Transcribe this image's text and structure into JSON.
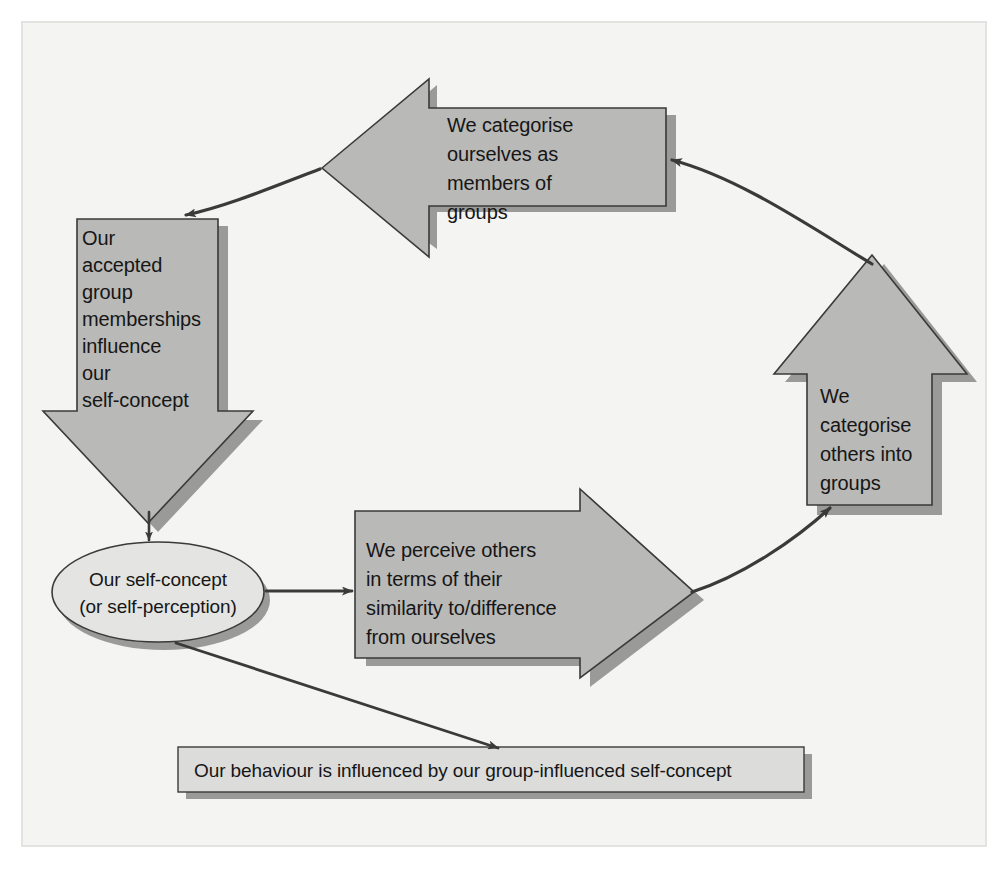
{
  "figure": {
    "frame": {
      "background_color": "#f4f4f2",
      "border_color": "#e2e2e0",
      "page_color": "#ffffff"
    },
    "palette": {
      "arrow_fill": "#b9b9b7",
      "arrow_stroke": "#3a3a3a",
      "arrow_shadow": "#9a9a98",
      "box_fill": "#dcdcda",
      "ellipse_fill": "#e4e4e2",
      "connector_color": "#3a3a3a",
      "text_color": "#161616"
    },
    "nodes": [
      {
        "id": "categorise-self",
        "shape": "left-arrow",
        "lines": [
          "We categorise",
          "ourselves as",
          "members of",
          "groups"
        ]
      },
      {
        "id": "group-memberships",
        "shape": "down-arrow",
        "lines": [
          "Our",
          "accepted",
          "group",
          "memberships",
          "influence",
          "our",
          "self-concept"
        ]
      },
      {
        "id": "self-concept",
        "shape": "ellipse",
        "lines": [
          "Our self-concept",
          "(or self-perception)"
        ]
      },
      {
        "id": "perceive-others",
        "shape": "right-arrow",
        "lines": [
          "We perceive others",
          "in terms of their",
          "similarity to/difference",
          "from ourselves"
        ]
      },
      {
        "id": "categorise-others",
        "shape": "up-arrow",
        "lines": [
          "We",
          "categorise",
          "others into",
          "groups"
        ]
      },
      {
        "id": "behaviour",
        "shape": "rectangle",
        "lines": [
          "Our behaviour is influenced by our group-influenced self-concept"
        ]
      }
    ],
    "connectors": [
      {
        "id": "top-left-curve",
        "from": "categorise-self",
        "to": "group-memberships"
      },
      {
        "id": "top-right-curve",
        "from": "categorise-others",
        "to": "categorise-self"
      },
      {
        "id": "memberships-to-self-concept",
        "from": "group-memberships",
        "to": "self-concept"
      },
      {
        "id": "self-concept-to-perceive",
        "from": "self-concept",
        "to": "perceive-others"
      },
      {
        "id": "perceive-to-categorise-others",
        "from": "perceive-others",
        "to": "categorise-others"
      },
      {
        "id": "self-concept-to-behaviour",
        "from": "self-concept",
        "to": "behaviour"
      }
    ]
  },
  "text": {
    "categorise_self": {
      "l1": "We categorise",
      "l2": "ourselves as",
      "l3": "members of",
      "l4": "groups"
    },
    "group_memberships": {
      "l1": "Our",
      "l2": "accepted",
      "l3": "group",
      "l4": "memberships",
      "l5": "influence",
      "l6": "our",
      "l7": "self-concept"
    },
    "self_concept": {
      "l1": "Our self-concept",
      "l2": "(or self-perception)"
    },
    "perceive_others": {
      "l1": "We perceive others",
      "l2": "in terms of their",
      "l3": "similarity to/difference",
      "l4": "from ourselves"
    },
    "categorise_others": {
      "l1": "We",
      "l2": "categorise",
      "l3": "others into",
      "l4": "groups"
    },
    "behaviour": {
      "l1": "Our behaviour is influenced by our group-influenced self-concept"
    }
  }
}
